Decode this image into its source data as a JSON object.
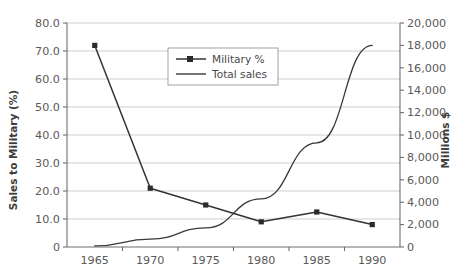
{
  "chart_data": {
    "type": "line",
    "title": "",
    "xlabel": "",
    "categories": [
      "1965",
      "1970",
      "1975",
      "1980",
      "1985",
      "1990"
    ],
    "x": [
      1965,
      1970,
      1975,
      1980,
      1985,
      1990
    ],
    "grid": true,
    "legend_position": "top-center",
    "series": [
      {
        "name": "Military %",
        "axis": "left",
        "marker": "square",
        "values": [
          72.0,
          21.0,
          15.0,
          9.0,
          12.5,
          8.0
        ]
      },
      {
        "name": "Total sales",
        "axis": "right",
        "marker": "none",
        "values": [
          100,
          700,
          1700,
          4300,
          9300,
          18000
        ]
      }
    ],
    "left_axis": {
      "label": "Sales to Military (%)",
      "ylim": [
        0.0,
        80.0
      ],
      "tick_step": 10.0,
      "ticks": [
        "0",
        "10.0",
        "20.0",
        "30.0",
        "40.0",
        "50.0",
        "60.0",
        "70.0",
        "80.0"
      ],
      "tick_values": [
        0,
        10,
        20,
        30,
        40,
        50,
        60,
        70,
        80
      ]
    },
    "right_axis": {
      "label": "Millions $",
      "ylim": [
        0,
        20000
      ],
      "tick_step": 2000,
      "ticks": [
        "0",
        "2,000",
        "4,000",
        "6,000",
        "8,000",
        "10,000",
        "12,000",
        "14,000",
        "16,000",
        "18,000",
        "20,000"
      ],
      "tick_values": [
        0,
        2000,
        4000,
        6000,
        8000,
        10000,
        12000,
        14000,
        16000,
        18000,
        20000
      ]
    },
    "colors": {
      "military_line": "#333333",
      "total_sales_line": "#3a3a3a",
      "gridline": "#b9b9b9",
      "axis": "#6e6e6e",
      "text": "#4d4d4d",
      "background": "#ffffff"
    }
  },
  "legend": {
    "items": [
      {
        "label": "Military %"
      },
      {
        "label": "Total sales"
      }
    ]
  }
}
